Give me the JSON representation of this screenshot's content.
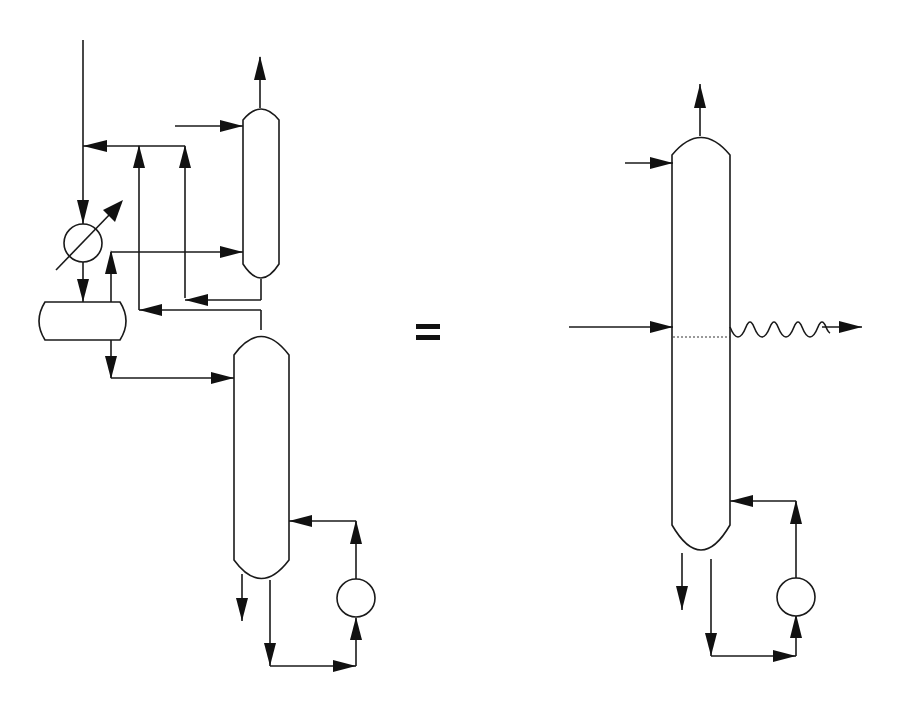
{
  "diagram": {
    "type": "process-flow-diagram",
    "colors": {
      "line": "#1a1a1a",
      "background": "#ffffff"
    },
    "left_system": {
      "components": [
        {
          "id": "feed-line",
          "label": "Feed stream (top, vertical)"
        },
        {
          "id": "heat-exchanger",
          "label": "Condenser / heat exchanger"
        },
        {
          "id": "reflux-drum",
          "label": "Horizontal drum"
        },
        {
          "id": "upper-column",
          "label": "Upper column"
        },
        {
          "id": "lower-column",
          "label": "Lower column"
        },
        {
          "id": "reboiler",
          "label": "Reboiler / pump"
        }
      ]
    },
    "operator": "=",
    "right_system": {
      "components": [
        {
          "id": "single-column",
          "label": "Single column"
        },
        {
          "id": "side-draw",
          "label": "Side draw (wavy line)"
        },
        {
          "id": "reboiler",
          "label": "Reboiler / pump"
        }
      ]
    }
  }
}
